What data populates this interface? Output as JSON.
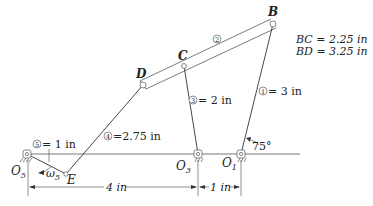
{
  "figure": {
    "type": "four-bar / six-bar linkage mechanism diagram",
    "joints": {
      "B": {
        "label": "B"
      },
      "C": {
        "label": "C"
      },
      "D": {
        "label": "D"
      },
      "E": {
        "label": "E"
      },
      "O1": {
        "label": "O",
        "sub": "1"
      },
      "O3": {
        "label": "O",
        "sub": "3"
      },
      "O5": {
        "label": "O",
        "sub": "5"
      }
    },
    "links": [
      {
        "num": "1",
        "label": "= 3 in"
      },
      {
        "num": "2",
        "label": ""
      },
      {
        "num": "3",
        "label": "= 2 in"
      },
      {
        "num": "4",
        "label": "=2.75 in"
      },
      {
        "num": "5",
        "label": "= 1 in"
      }
    ],
    "dimensions": {
      "BC": "BC = 2.25 in",
      "BD": "BD = 3.25 in",
      "O5_O3": "4 in",
      "O3_O1": "1 in",
      "angle": "75°"
    },
    "omega": {
      "symbol": "ω",
      "sub": "5"
    },
    "colors": {
      "line": "#333333",
      "background": "#ffffff"
    }
  }
}
